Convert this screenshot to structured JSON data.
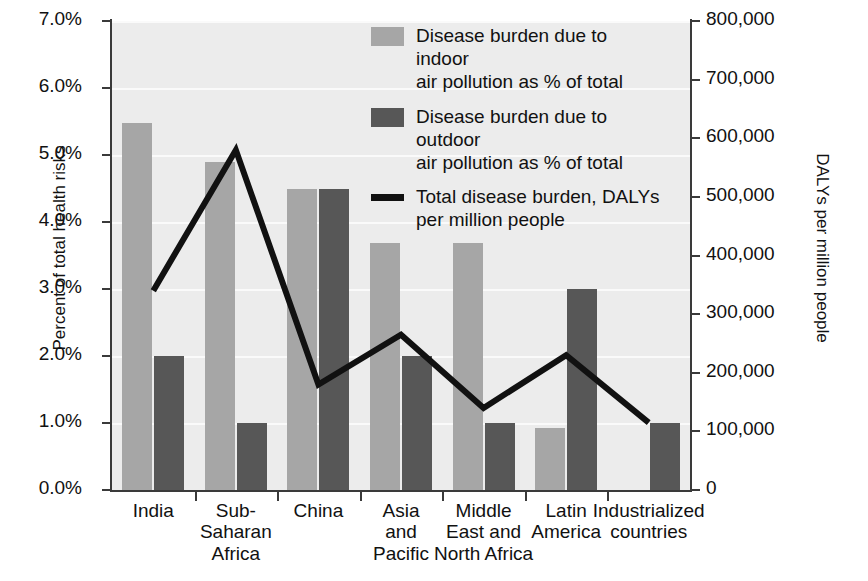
{
  "chart_data": {
    "type": "bar",
    "title": "",
    "subtitle": "",
    "xlabel": "",
    "ylabel": "Percent of total health risks",
    "y2label": "DALYs per million people",
    "grid": true,
    "legend_position": "top-center",
    "categories": [
      "India",
      "Sub-\nSaharan\nAfrica",
      "China",
      "Asia\nand\nPacific",
      "Middle\nEast and\nNorth Africa",
      "Latin\nAmerica",
      "Industrialized\ncountries"
    ],
    "ylim": [
      0,
      7
    ],
    "yticks": [
      0,
      1,
      2,
      3,
      4,
      5,
      6,
      7
    ],
    "ytick_labels": [
      "0.0%",
      "1.0%",
      "2.0%",
      "3.0%",
      "4.0%",
      "5.0%",
      "6.0%",
      "7.0%"
    ],
    "y2lim": [
      0,
      800000
    ],
    "y2ticks": [
      0,
      100000,
      200000,
      300000,
      400000,
      500000,
      600000,
      700000,
      800000
    ],
    "y2tick_labels": [
      "0",
      "100,000",
      "200,000",
      "300,000",
      "400,000",
      "500,000",
      "600,000",
      "700,000",
      "800,000"
    ],
    "series": [
      {
        "name": "Disease burden due to indoor\nair pollution as % of total",
        "kind": "bar",
        "axis": "left",
        "color": "#a6a6a6",
        "values": [
          5.48,
          4.9,
          4.5,
          3.68,
          3.68,
          0.92,
          0
        ]
      },
      {
        "name": "Disease burden due to outdoor\nair pollution as % of total",
        "kind": "bar",
        "axis": "left",
        "color": "#575757",
        "values": [
          2.0,
          1.0,
          4.5,
          2.0,
          1.0,
          3.0,
          1.0
        ]
      },
      {
        "name": "Total disease burden, DALYs\nper million people",
        "kind": "line",
        "axis": "right",
        "color": "#111111",
        "values": [
          340000,
          580000,
          180000,
          265000,
          140000,
          230000,
          115000
        ]
      }
    ]
  },
  "legend": {
    "items": [
      {
        "marker": "swatch",
        "label": "Disease burden due to indoor\nair pollution as % of total"
      },
      {
        "marker": "swatch",
        "label": "Disease burden due to outdoor\nair pollution as % of total"
      },
      {
        "marker": "line",
        "label": "Total disease burden, DALYs\nper million people"
      }
    ]
  }
}
